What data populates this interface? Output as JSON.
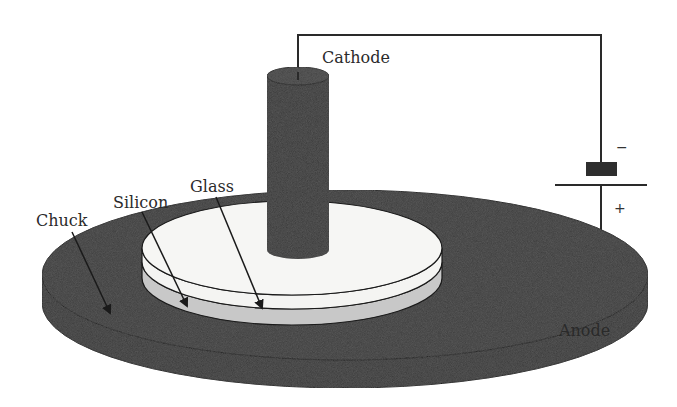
{
  "diagram": {
    "labels": {
      "cathode": "Cathode",
      "anode": "Anode",
      "glass": "Glass",
      "silicon": "Silicon",
      "chuck": "Chuck",
      "minus": "−",
      "plus": "+"
    },
    "colors": {
      "chuck": "#3a3a3a",
      "cathode": "#3a3a3a",
      "glass": "#f4f4f2",
      "silicon": "#c8c8c8",
      "wire": "#2a2a2a",
      "battery_neg": "#2e2e2e"
    }
  }
}
